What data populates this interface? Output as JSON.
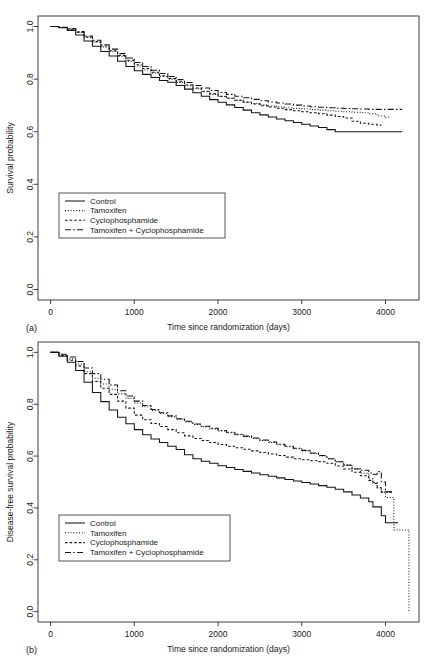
{
  "figure": {
    "panels": [
      "a",
      "b"
    ]
  },
  "chart_data": [
    {
      "panel_label": "(a)",
      "type": "line",
      "title": "",
      "xlabel": "Time since randomization (days)",
      "ylabel": "Survival probability",
      "xlim": [
        -150,
        4400
      ],
      "ylim": [
        -0.04,
        1.04
      ],
      "xticks": [
        0,
        1000,
        2000,
        3000,
        4000
      ],
      "xtick_labels": [
        "0",
        "1000",
        "2000",
        "3000",
        "4000"
      ],
      "yticks": [
        0.0,
        0.2,
        0.4,
        0.6,
        0.8,
        1.0
      ],
      "ytick_labels": [
        "0.0",
        "0.2",
        "0.4",
        "0.6",
        "0.8",
        "1.0"
      ],
      "grid": false,
      "legend_position": "lower left",
      "series": [
        {
          "name": "Control",
          "dash": "solid",
          "x": [
            0,
            100,
            200,
            300,
            400,
            500,
            600,
            700,
            800,
            900,
            1000,
            1100,
            1200,
            1300,
            1400,
            1500,
            1600,
            1700,
            1800,
            1900,
            2000,
            2100,
            2200,
            2300,
            2400,
            2500,
            2600,
            2700,
            2800,
            2900,
            3000,
            3100,
            3200,
            3300,
            3400,
            3500,
            3600,
            3700,
            3800,
            3900,
            4000,
            4100,
            4200
          ],
          "y": [
            1.0,
            0.995,
            0.985,
            0.968,
            0.945,
            0.925,
            0.905,
            0.888,
            0.868,
            0.848,
            0.832,
            0.818,
            0.806,
            0.795,
            0.788,
            0.776,
            0.762,
            0.748,
            0.735,
            0.722,
            0.712,
            0.702,
            0.692,
            0.682,
            0.672,
            0.664,
            0.656,
            0.648,
            0.642,
            0.635,
            0.628,
            0.622,
            0.616,
            0.608,
            0.6,
            0.6,
            0.6,
            0.6,
            0.6,
            0.6,
            0.6,
            0.6,
            0.6
          ]
        },
        {
          "name": "Tamoxifen",
          "dash": "dotted",
          "x": [
            0,
            100,
            200,
            300,
            400,
            500,
            600,
            700,
            800,
            900,
            1000,
            1100,
            1200,
            1300,
            1400,
            1500,
            1600,
            1700,
            1800,
            1900,
            2000,
            2100,
            2200,
            2300,
            2400,
            2500,
            2600,
            2700,
            2800,
            2900,
            3000,
            3100,
            3200,
            3300,
            3400,
            3500,
            3600,
            3700,
            3800,
            3900,
            4000,
            4050
          ],
          "y": [
            1.0,
            0.996,
            0.99,
            0.977,
            0.958,
            0.94,
            0.922,
            0.905,
            0.886,
            0.868,
            0.85,
            0.835,
            0.822,
            0.81,
            0.8,
            0.787,
            0.775,
            0.763,
            0.752,
            0.742,
            0.734,
            0.727,
            0.72,
            0.713,
            0.707,
            0.702,
            0.698,
            0.694,
            0.691,
            0.688,
            0.686,
            0.684,
            0.682,
            0.68,
            0.678,
            0.676,
            0.674,
            0.672,
            0.668,
            0.66,
            0.655,
            0.655
          ]
        },
        {
          "name": "Cyclophosphamide",
          "dash": "dashed-short",
          "x": [
            0,
            100,
            200,
            300,
            400,
            500,
            600,
            700,
            800,
            900,
            1000,
            1100,
            1200,
            1300,
            1400,
            1500,
            1600,
            1700,
            1800,
            1900,
            2000,
            2100,
            2200,
            2300,
            2400,
            2500,
            2600,
            2700,
            2800,
            2900,
            3000,
            3100,
            3200,
            3300,
            3400,
            3500,
            3600,
            3700,
            3800,
            3900,
            3950
          ],
          "y": [
            1.0,
            0.996,
            0.99,
            0.978,
            0.96,
            0.943,
            0.926,
            0.908,
            0.89,
            0.872,
            0.855,
            0.84,
            0.826,
            0.813,
            0.802,
            0.79,
            0.778,
            0.766,
            0.754,
            0.744,
            0.735,
            0.727,
            0.72,
            0.712,
            0.705,
            0.699,
            0.694,
            0.689,
            0.684,
            0.68,
            0.676,
            0.672,
            0.668,
            0.663,
            0.658,
            0.652,
            0.64,
            0.632,
            0.628,
            0.625,
            0.625
          ]
        },
        {
          "name": "Tamoxifen + Cyclophosphamide",
          "dash": "dash-dot",
          "x": [
            0,
            100,
            200,
            300,
            400,
            500,
            600,
            700,
            800,
            900,
            1000,
            1100,
            1200,
            1300,
            1400,
            1500,
            1600,
            1700,
            1800,
            1900,
            2000,
            2100,
            2200,
            2300,
            2400,
            2500,
            2600,
            2700,
            2800,
            2900,
            3000,
            3100,
            3200,
            3300,
            3400,
            3500,
            3600,
            3700,
            3800,
            3900,
            4000,
            4100,
            4200
          ],
          "y": [
            1.0,
            0.997,
            0.992,
            0.981,
            0.964,
            0.948,
            0.931,
            0.914,
            0.897,
            0.88,
            0.863,
            0.848,
            0.834,
            0.821,
            0.81,
            0.798,
            0.787,
            0.776,
            0.766,
            0.757,
            0.749,
            0.742,
            0.735,
            0.729,
            0.723,
            0.718,
            0.713,
            0.709,
            0.705,
            0.701,
            0.698,
            0.695,
            0.693,
            0.691,
            0.689,
            0.688,
            0.687,
            0.686,
            0.685,
            0.685,
            0.685,
            0.685,
            0.685
          ]
        }
      ]
    },
    {
      "panel_label": "(b)",
      "type": "line",
      "title": "",
      "xlabel": "Time since randomization (days)",
      "ylabel": "Disease-free survival probability",
      "xlim": [
        -150,
        4400
      ],
      "ylim": [
        -0.04,
        1.04
      ],
      "xticks": [
        0,
        1000,
        2000,
        3000,
        4000
      ],
      "xtick_labels": [
        "0",
        "1000",
        "2000",
        "3000",
        "4000"
      ],
      "yticks": [
        0.0,
        0.2,
        0.4,
        0.6,
        0.8,
        1.0
      ],
      "ytick_labels": [
        "0.0",
        "0.2",
        "0.4",
        "0.6",
        "0.8",
        "1.0"
      ],
      "grid": false,
      "legend_position": "lower left",
      "series": [
        {
          "name": "Control",
          "dash": "solid",
          "x": [
            0,
            100,
            200,
            300,
            400,
            500,
            600,
            700,
            800,
            900,
            1000,
            1100,
            1200,
            1300,
            1400,
            1500,
            1600,
            1700,
            1800,
            1900,
            2000,
            2100,
            2200,
            2300,
            2400,
            2500,
            2600,
            2700,
            2800,
            2900,
            3000,
            3100,
            3200,
            3300,
            3400,
            3500,
            3600,
            3700,
            3800,
            3850,
            3900,
            3950,
            4000,
            4050,
            4100,
            4150
          ],
          "y": [
            1.0,
            0.985,
            0.962,
            0.93,
            0.885,
            0.845,
            0.81,
            0.778,
            0.75,
            0.725,
            0.702,
            0.682,
            0.666,
            0.652,
            0.638,
            0.625,
            0.605,
            0.59,
            0.58,
            0.572,
            0.563,
            0.556,
            0.548,
            0.541,
            0.535,
            0.528,
            0.522,
            0.516,
            0.51,
            0.504,
            0.498,
            0.492,
            0.486,
            0.48,
            0.472,
            0.462,
            0.45,
            0.438,
            0.424,
            0.404,
            0.404,
            0.37,
            0.343,
            0.343,
            0.343,
            0.343
          ]
        },
        {
          "name": "Tamoxifen",
          "dash": "dotted",
          "x": [
            0,
            100,
            200,
            300,
            400,
            500,
            600,
            700,
            800,
            900,
            1000,
            1100,
            1200,
            1300,
            1400,
            1500,
            1600,
            1700,
            1800,
            1900,
            2000,
            2100,
            2200,
            2300,
            2400,
            2500,
            2600,
            2700,
            2800,
            2900,
            3000,
            3100,
            3200,
            3300,
            3400,
            3500,
            3600,
            3700,
            3800,
            3850,
            3900,
            3950,
            4000,
            4100,
            4200,
            4260,
            4280
          ],
          "y": [
            1.0,
            0.99,
            0.975,
            0.955,
            0.925,
            0.9,
            0.878,
            0.858,
            0.84,
            0.822,
            0.805,
            0.79,
            0.776,
            0.764,
            0.752,
            0.742,
            0.732,
            0.722,
            0.713,
            0.705,
            0.697,
            0.69,
            0.682,
            0.675,
            0.668,
            0.66,
            0.652,
            0.644,
            0.636,
            0.628,
            0.62,
            0.61,
            0.6,
            0.59,
            0.578,
            0.566,
            0.552,
            0.534,
            0.512,
            0.498,
            0.478,
            0.46,
            0.44,
            0.315,
            0.315,
            0.315,
            0.0
          ]
        },
        {
          "name": "Cyclophosphamide",
          "dash": "dashed-short",
          "x": [
            0,
            100,
            200,
            300,
            400,
            500,
            600,
            700,
            800,
            900,
            1000,
            1100,
            1200,
            1300,
            1400,
            1500,
            1600,
            1700,
            1800,
            1900,
            2000,
            2100,
            2200,
            2300,
            2400,
            2500,
            2600,
            2700,
            2800,
            2900,
            3000,
            3100,
            3200,
            3300,
            3400,
            3500,
            3600,
            3700,
            3800,
            3850,
            3900,
            3950,
            4000,
            4050,
            4100
          ],
          "y": [
            1.0,
            0.988,
            0.97,
            0.948,
            0.918,
            0.888,
            0.862,
            0.838,
            0.812,
            0.785,
            0.758,
            0.74,
            0.726,
            0.714,
            0.702,
            0.69,
            0.678,
            0.668,
            0.66,
            0.652,
            0.645,
            0.638,
            0.632,
            0.626,
            0.62,
            0.614,
            0.608,
            0.602,
            0.596,
            0.59,
            0.586,
            0.582,
            0.578,
            0.572,
            0.562,
            0.55,
            0.538,
            0.524,
            0.506,
            0.494,
            0.478,
            0.462,
            0.462,
            0.462,
            0.462
          ]
        },
        {
          "name": "Tamoxifen + Cyclophosphamide",
          "dash": "dash-dot",
          "x": [
            0,
            100,
            200,
            300,
            400,
            500,
            600,
            700,
            800,
            900,
            1000,
            1100,
            1200,
            1300,
            1400,
            1500,
            1600,
            1700,
            1800,
            1900,
            2000,
            2100,
            2200,
            2300,
            2400,
            2500,
            2600,
            2700,
            2800,
            2900,
            3000,
            3100,
            3200,
            3300,
            3400,
            3500,
            3600,
            3700,
            3800,
            3850,
            3900,
            3950,
            4000,
            4050,
            4100
          ],
          "y": [
            1.0,
            0.993,
            0.982,
            0.965,
            0.94,
            0.918,
            0.896,
            0.874,
            0.852,
            0.832,
            0.812,
            0.795,
            0.78,
            0.767,
            0.755,
            0.744,
            0.734,
            0.724,
            0.715,
            0.707,
            0.699,
            0.692,
            0.684,
            0.677,
            0.67,
            0.662,
            0.654,
            0.646,
            0.638,
            0.63,
            0.622,
            0.612,
            0.602,
            0.59,
            0.578,
            0.565,
            0.55,
            0.545,
            0.535,
            0.53,
            0.54,
            0.5,
            0.462,
            0.462,
            0.462
          ]
        }
      ]
    }
  ],
  "legend": {
    "entries": [
      {
        "label": "Control",
        "dash": "solid"
      },
      {
        "label": "Tamoxifen",
        "dash": "dotted"
      },
      {
        "label": "Cyclophosphamide",
        "dash": "dashed-short"
      },
      {
        "label": "Tamoxifen + Cyclophosphamide",
        "dash": "dash-dot"
      }
    ]
  }
}
